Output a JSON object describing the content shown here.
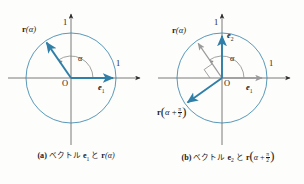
{
  "figure": {
    "background_color": "#fdfdfb",
    "accent_color": "#2f7fa8",
    "circle_color": "#3b86ae",
    "axis_color": "#6b6b6b",
    "gray_vector_color": "#9a9a9a",
    "text_color": "#1a1a1a"
  },
  "panels": [
    {
      "id": "a",
      "tag": "(a)",
      "caption_jp": "ベクトル",
      "caption_conj": "と",
      "caption_vec1": "e",
      "caption_vec1_sub": "1",
      "caption_vec2": "r",
      "caption_vec2_arg": "(α)",
      "center": {
        "x": 71,
        "y": 78
      },
      "radius": 45,
      "labels": {
        "origin": "O",
        "unit_x": "1",
        "unit_y": "1",
        "angle": "α",
        "vector_r": "r(α)",
        "vector_e1": "e",
        "vector_e1_sub": "1"
      },
      "vectors": [
        {
          "name": "e1",
          "angle_deg": 0,
          "color": "#2f7fa8",
          "style": "solid-accent"
        },
        {
          "name": "r-alpha",
          "angle_deg": 125,
          "color": "#2f7fa8",
          "style": "solid-accent"
        }
      ],
      "angle_arc": {
        "from_deg": 0,
        "to_deg": 125,
        "radius": 22
      }
    },
    {
      "id": "b",
      "tag": "(b)",
      "caption_jp": "ベクトル",
      "caption_conj": "と",
      "caption_vec1": "e",
      "caption_vec1_sub": "2",
      "caption_vec2": "r",
      "caption_vec2_arg_open": "(α +",
      "caption_frac_num": "π",
      "caption_frac_den": "2",
      "caption_vec2_arg_close": ")",
      "center": {
        "x": 70,
        "y": 78
      },
      "radius": 45,
      "labels": {
        "origin": "O",
        "unit_x": "1",
        "unit_y": "1",
        "angle": "α",
        "vector_r": "r(α)",
        "vector_e1": "e",
        "vector_e1_sub": "1",
        "vector_e2": "e",
        "vector_e2_sub": "2",
        "vector_r_rot": "r(α + π/2)",
        "vector_r_rot_head": "r",
        "vector_r_rot_open": "(α +",
        "vector_r_rot_num": "π",
        "vector_r_rot_den": "2",
        "vector_r_rot_close": ")"
      },
      "vectors": [
        {
          "name": "e1",
          "angle_deg": 0,
          "color": "#9a9a9a",
          "style": "gray"
        },
        {
          "name": "e2",
          "angle_deg": 90,
          "color": "#2f7fa8",
          "style": "solid-accent"
        },
        {
          "name": "r-alpha",
          "angle_deg": 125,
          "color": "#9a9a9a",
          "style": "gray"
        },
        {
          "name": "r-alpha-plus-half-pi",
          "angle_deg": 215,
          "color": "#2f7fa8",
          "style": "solid-accent"
        }
      ],
      "angle_arc": {
        "from_deg": 0,
        "to_deg": 125,
        "radius": 22
      },
      "right_angle_marker": {
        "between": [
          "r-alpha",
          "r-alpha-plus-half-pi"
        ],
        "size": 9
      }
    }
  ]
}
